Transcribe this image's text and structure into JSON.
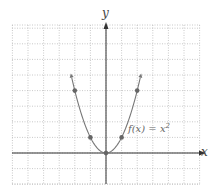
{
  "chart_data": {
    "type": "line",
    "title": "",
    "xlabel": "x",
    "ylabel": "y",
    "function_label": "f(x) = x²",
    "xlim": [
      -6,
      6
    ],
    "ylim": [
      -2,
      8.3
    ],
    "grid": true,
    "grid_style": "dotted",
    "points": [
      {
        "x": -2,
        "y": 4
      },
      {
        "x": -1,
        "y": 1
      },
      {
        "x": 0,
        "y": 0
      },
      {
        "x": 1,
        "y": 1
      },
      {
        "x": 2,
        "y": 4
      }
    ],
    "curve": {
      "expr": "x^2",
      "x_range": [
        -2.2,
        2.2
      ],
      "arrows_at_ends": true
    },
    "colors": {
      "curve": "#777777",
      "points": "#666666",
      "axes": "#333333",
      "grid": "#bbbbbb"
    }
  },
  "labels": {
    "x_axis": "x",
    "y_axis": "y",
    "func_name": "f(x) = x",
    "func_exp": "2"
  }
}
